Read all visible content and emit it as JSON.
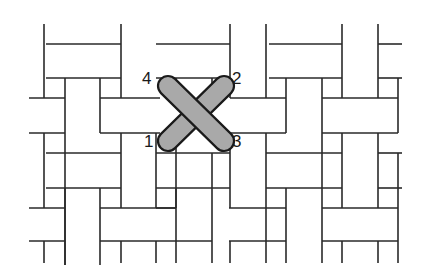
{
  "diagram": {
    "title": "",
    "colors": {
      "background": "#ffffff",
      "line": "#2a2a2a",
      "stitch_fill": "#a9a9a9",
      "stitch_outline": "#1a1a1a"
    },
    "labels": [
      {
        "id": "1",
        "text": "1",
        "x": 144,
        "y": 143
      },
      {
        "id": "2",
        "text": "2",
        "x": 232,
        "y": 80
      },
      {
        "id": "3",
        "text": "3",
        "x": 232,
        "y": 143
      },
      {
        "id": "4",
        "text": "4",
        "x": 142,
        "y": 80
      }
    ],
    "stitches": [
      {
        "name": "stitch-1-to-2",
        "from": [
          168,
          141
        ],
        "to": [
          224,
          86
        ]
      },
      {
        "name": "stitch-4-to-3",
        "from": [
          168,
          86
        ],
        "to": [
          224,
          141
        ]
      }
    ],
    "lines": [
      [
        44,
        24,
        44,
        98
      ],
      [
        121,
        24,
        121,
        98
      ],
      [
        46,
        44,
        121,
        44
      ],
      [
        46,
        78,
        121,
        78
      ],
      [
        65,
        78,
        65,
        265
      ],
      [
        100,
        78,
        100,
        133
      ],
      [
        29,
        98,
        65,
        98
      ],
      [
        100,
        98,
        160,
        98
      ],
      [
        29,
        133,
        65,
        133
      ],
      [
        100,
        133,
        160,
        133
      ],
      [
        44,
        133,
        44,
        208
      ],
      [
        121,
        133,
        121,
        208
      ],
      [
        46,
        153,
        121,
        153
      ],
      [
        46,
        188,
        121,
        188
      ],
      [
        65,
        188,
        65,
        265
      ],
      [
        100,
        188,
        100,
        265
      ],
      [
        29,
        208,
        65,
        208
      ],
      [
        100,
        208,
        176,
        208
      ],
      [
        29,
        241,
        65,
        241
      ],
      [
        100,
        241,
        176,
        241
      ],
      [
        44,
        241,
        44,
        263
      ],
      [
        121,
        241,
        121,
        263
      ],
      [
        156,
        241,
        156,
        263
      ],
      [
        156,
        44,
        230,
        44
      ],
      [
        156,
        78,
        230,
        78
      ],
      [
        230,
        24,
        230,
        98
      ],
      [
        266,
        24,
        266,
        98
      ],
      [
        176,
        78,
        176,
        98
      ],
      [
        212,
        78,
        212,
        98
      ],
      [
        156,
        133,
        156,
        208
      ],
      [
        176,
        143,
        176,
        208
      ],
      [
        156,
        153,
        230,
        153
      ],
      [
        156,
        188,
        230,
        188
      ],
      [
        230,
        133,
        230,
        208
      ],
      [
        266,
        133,
        266,
        208
      ],
      [
        212,
        153,
        212,
        208
      ],
      [
        230,
        98,
        286,
        98
      ],
      [
        230,
        133,
        286,
        133
      ],
      [
        156,
        208,
        176,
        208
      ],
      [
        176,
        188,
        176,
        263
      ],
      [
        212,
        208,
        212,
        263
      ],
      [
        230,
        241,
        230,
        263
      ],
      [
        176,
        241,
        212,
        241
      ],
      [
        286,
        78,
        286,
        133
      ],
      [
        322,
        78,
        322,
        263
      ],
      [
        269,
        44,
        342,
        44
      ],
      [
        269,
        78,
        342,
        78
      ],
      [
        342,
        24,
        342,
        98
      ],
      [
        378,
        24,
        378,
        98
      ],
      [
        378,
        44,
        402,
        44
      ],
      [
        378,
        78,
        402,
        78
      ],
      [
        398,
        78,
        398,
        133
      ],
      [
        322,
        98,
        398,
        98
      ],
      [
        322,
        133,
        398,
        133
      ],
      [
        266,
        153,
        342,
        153
      ],
      [
        266,
        188,
        342,
        188
      ],
      [
        342,
        133,
        342,
        208
      ],
      [
        378,
        133,
        378,
        208
      ],
      [
        286,
        188,
        286,
        263
      ],
      [
        266,
        208,
        266,
        263
      ],
      [
        398,
        153,
        398,
        263
      ],
      [
        378,
        153,
        402,
        153
      ],
      [
        378,
        188,
        402,
        188
      ],
      [
        229,
        208,
        286,
        208
      ],
      [
        229,
        241,
        286,
        241
      ],
      [
        322,
        208,
        398,
        208
      ],
      [
        322,
        241,
        398,
        241
      ],
      [
        342,
        241,
        342,
        263
      ],
      [
        378,
        241,
        378,
        263
      ]
    ]
  }
}
